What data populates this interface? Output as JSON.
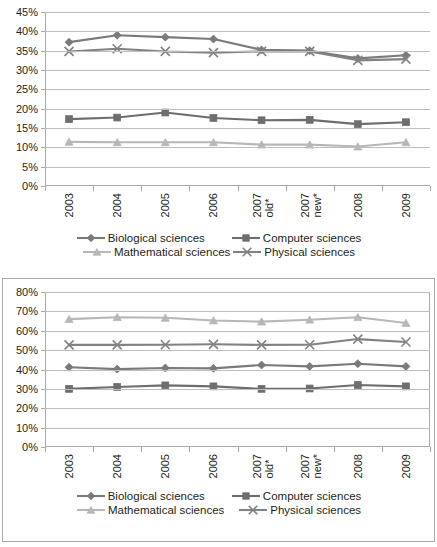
{
  "series_meta": [
    {
      "key": "biological",
      "label": "Biological sciences",
      "marker": "diamond",
      "color": "#7a7a7a"
    },
    {
      "key": "computer",
      "label": "Computer sciences",
      "marker": "square",
      "color": "#6d6e71"
    },
    {
      "key": "mathematical",
      "label": "Mathematical sciences",
      "marker": "triangle",
      "color": "#b7b7b7"
    },
    {
      "key": "physical",
      "label": "Physical sciences",
      "marker": "x",
      "color": "#808285"
    }
  ],
  "legend": {
    "row1": [
      "Biological sciences",
      "Computer sciences"
    ],
    "row2": [
      "Mathematical sciences",
      "Physical sciences"
    ]
  },
  "chart_data": [
    {
      "type": "line",
      "id": "top-chart",
      "title": "",
      "xlabel": "",
      "ylabel": "",
      "grid": true,
      "legend_position": "bottom",
      "ylim": [
        0,
        45
      ],
      "ytick_labels": [
        "45%",
        "40%",
        "35%",
        "30%",
        "25%",
        "20%",
        "15%",
        "10%",
        "5%",
        "0%"
      ],
      "ytick_values": [
        45,
        40,
        35,
        30,
        25,
        20,
        15,
        10,
        5,
        0
      ],
      "categories": [
        "2003",
        "2004",
        "2005",
        "2006",
        "2007 old*",
        "2007 new*",
        "2008",
        "2009"
      ],
      "category_lines": [
        [
          "2003"
        ],
        [
          "2004"
        ],
        [
          "2005"
        ],
        [
          "2006"
        ],
        [
          "2007",
          "old*"
        ],
        [
          "2007",
          "new*"
        ],
        [
          "2008"
        ],
        [
          "2009"
        ]
      ],
      "series": [
        {
          "name": "Biological sciences",
          "values": [
            37.2,
            39.0,
            38.5,
            38.0,
            35.2,
            35.0,
            33.0,
            33.8
          ]
        },
        {
          "name": "Computer sciences",
          "values": [
            17.3,
            17.7,
            19.0,
            17.6,
            17.0,
            17.1,
            16.0,
            16.5
          ]
        },
        {
          "name": "Mathematical sciences",
          "values": [
            11.4,
            11.3,
            11.3,
            11.3,
            10.7,
            10.7,
            10.2,
            11.3
          ]
        },
        {
          "name": "Physical sciences",
          "values": [
            34.8,
            35.5,
            34.8,
            34.5,
            34.8,
            34.8,
            32.5,
            32.8
          ]
        }
      ]
    },
    {
      "type": "line",
      "id": "bottom-chart",
      "title": "",
      "xlabel": "",
      "ylabel": "",
      "grid": true,
      "legend_position": "bottom",
      "ylim": [
        0,
        80
      ],
      "ytick_labels": [
        "80%",
        "70%",
        "60%",
        "50%",
        "40%",
        "30%",
        "20%",
        "10%",
        "0%"
      ],
      "ytick_values": [
        80,
        70,
        60,
        50,
        40,
        30,
        20,
        10,
        0
      ],
      "categories": [
        "2003",
        "2004",
        "2005",
        "2006",
        "2007 old*",
        "2007 new*",
        "2008",
        "2009"
      ],
      "category_lines": [
        [
          "2003"
        ],
        [
          "2004"
        ],
        [
          "2005"
        ],
        [
          "2006"
        ],
        [
          "2007",
          "old*"
        ],
        [
          "2007",
          "new*"
        ],
        [
          "2008"
        ],
        [
          "2009"
        ]
      ],
      "series": [
        {
          "name": "Biological sciences",
          "values": [
            41.2,
            40.2,
            40.8,
            40.6,
            42.3,
            41.6,
            43.0,
            41.6
          ]
        },
        {
          "name": "Computer sciences",
          "values": [
            30.0,
            31.0,
            31.8,
            31.3,
            30.0,
            30.2,
            32.0,
            31.3
          ]
        },
        {
          "name": "Mathematical sciences",
          "values": [
            66.0,
            67.0,
            66.7,
            65.3,
            64.7,
            65.7,
            67.0,
            64.0
          ]
        },
        {
          "name": "Physical sciences",
          "values": [
            52.7,
            52.7,
            52.8,
            53.0,
            52.7,
            52.8,
            55.7,
            54.2
          ]
        }
      ]
    }
  ]
}
